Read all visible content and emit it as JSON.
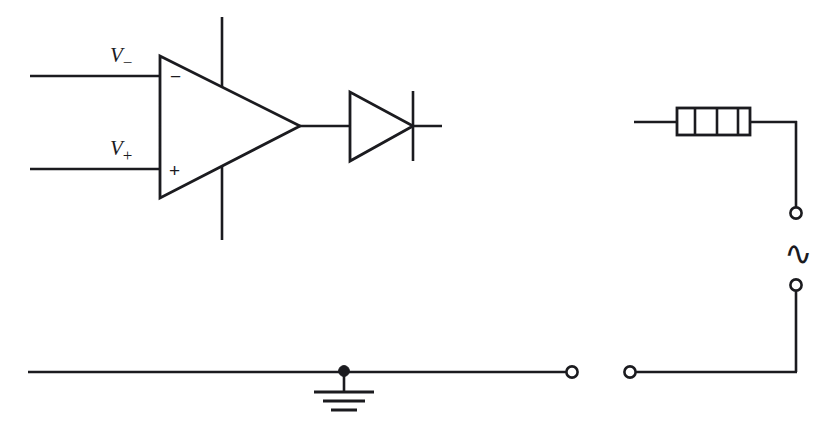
{
  "diagram": {
    "type": "electronic-schematic",
    "stroke_color": "#1b1b1f",
    "background_color": "#ffffff",
    "labels": {
      "inverting_input": "V",
      "inverting_input_subscript": "−",
      "noninverting_input": "V",
      "noninverting_input_subscript": "+",
      "opamp_minus_sign": "−",
      "opamp_plus_sign": "+",
      "ac_source_symbol": "∿"
    },
    "components": [
      {
        "id": "opamp",
        "name": "operational-amplifier",
        "symbol": "triangle"
      },
      {
        "id": "diode",
        "name": "diode",
        "symbol": "triangle-with-bar"
      },
      {
        "id": "resistor",
        "name": "resistor",
        "symbol": "banded-box",
        "bands": 3
      },
      {
        "id": "ground",
        "name": "ground",
        "symbol": "three-bar-earth"
      },
      {
        "id": "ac_source",
        "name": "ac-source",
        "symbol": "tilde"
      }
    ],
    "terminals": [
      {
        "id": "out-left",
        "name": "output-terminal-left"
      },
      {
        "id": "out-right",
        "name": "output-terminal-right"
      },
      {
        "id": "ac-top",
        "name": "ac-terminal-top"
      },
      {
        "id": "ac-bottom",
        "name": "ac-terminal-bottom"
      }
    ]
  }
}
